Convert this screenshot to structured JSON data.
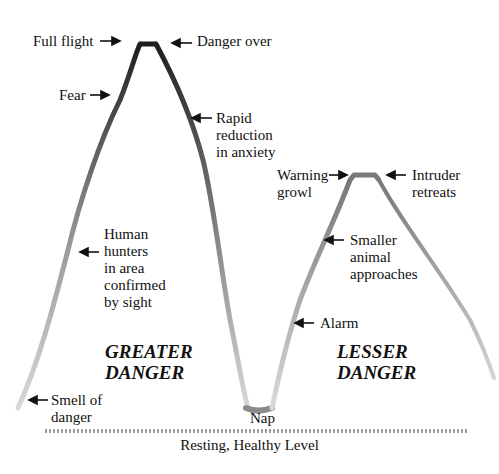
{
  "diagram": {
    "type": "stress-response-curve",
    "regions": {
      "greater": [
        "GREATER",
        "DANGER"
      ],
      "lesser": [
        "LESSER",
        "DANGER"
      ]
    },
    "baseline_label": "Resting, Healthy Level",
    "labels": {
      "full_flight": "Full flight",
      "danger_over": "Danger over",
      "fear": "Fear",
      "rapid": [
        "Rapid",
        "reduction",
        "in anxiety"
      ],
      "human": [
        "Human",
        "hunters",
        "in area",
        "confirmed",
        "by sight"
      ],
      "smell": [
        "Smell of",
        "danger"
      ],
      "nap": "Nap",
      "alarm": "Alarm",
      "warning": [
        "Warning",
        "growl"
      ],
      "intruder": [
        "Intruder",
        "retreats"
      ],
      "smaller": [
        "Smaller",
        "animal",
        "approaches"
      ]
    },
    "colors": {
      "peak": "#222222",
      "mid": "#777777",
      "low": "#cfcfcf",
      "nap": "#888888",
      "baseline": "#9a9a9a"
    }
  }
}
